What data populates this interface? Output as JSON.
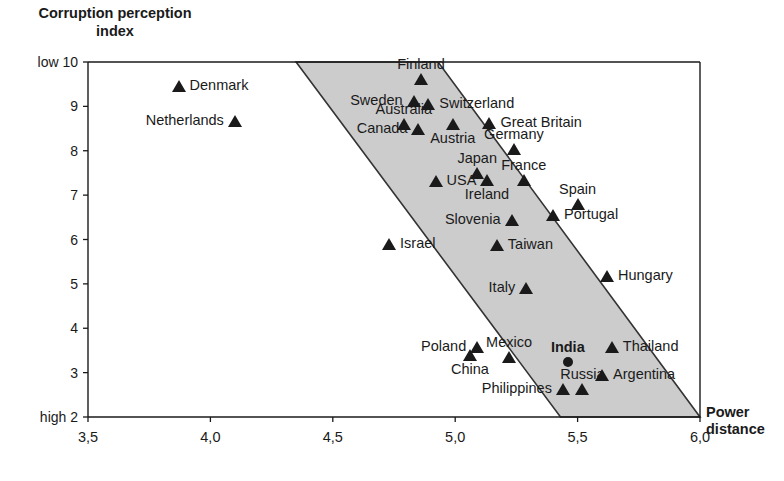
{
  "chart_data": {
    "type": "scatter",
    "title": "Corruption perception index",
    "ylabel": "Corruption perception\nindex",
    "xlabel": "Power\ndistance",
    "xlim": [
      3.5,
      6.0
    ],
    "ylim": [
      2,
      10
    ],
    "x_ticks": [
      "3,5",
      "4,0",
      "4,5",
      "5,0",
      "5,5",
      "6,0"
    ],
    "x_tick_values": [
      3.5,
      4.0,
      4.5,
      5.0,
      5.5,
      6.0
    ],
    "y_ticks": [
      "10",
      "9",
      "8",
      "7",
      "6",
      "5",
      "4",
      "3",
      "2"
    ],
    "y_tick_values": [
      10,
      9,
      8,
      7,
      6,
      5,
      4,
      3,
      2
    ],
    "y_axis_end_low": "low",
    "y_axis_end_high": "high",
    "grid": false,
    "legend": "none",
    "band": {
      "label": "trend-band",
      "fill": "#cccccc",
      "stroke": "#333333",
      "corners_data": [
        [
          4.35,
          10.0
        ],
        [
          4.93,
          10.0
        ],
        [
          6.0,
          2.0
        ],
        [
          5.43,
          2.0
        ]
      ]
    },
    "points": [
      {
        "name": "Denmark",
        "x": 3.87,
        "y": 9.45,
        "marker": "triangle",
        "label_side": "right",
        "bold": false
      },
      {
        "name": "Netherlands",
        "x": 4.1,
        "y": 8.68,
        "marker": "triangle",
        "label_side": "left",
        "bold": false
      },
      {
        "name": "Finland",
        "x": 4.86,
        "y": 9.62,
        "marker": "triangle",
        "label_side": "above",
        "bold": false
      },
      {
        "name": "Sweden",
        "x": 4.83,
        "y": 9.12,
        "marker": "triangle",
        "label_side": "left",
        "bold": false
      },
      {
        "name": "Switzerland",
        "x": 4.89,
        "y": 9.05,
        "marker": "triangle",
        "label_side": "right",
        "bold": false
      },
      {
        "name": "Australia",
        "x": 4.79,
        "y": 8.6,
        "marker": "triangle",
        "label_side": "above",
        "bold": false
      },
      {
        "name": "Canada",
        "x": 4.85,
        "y": 8.48,
        "marker": "triangle",
        "label_side": "left",
        "bold": false
      },
      {
        "name": "Austria",
        "x": 4.99,
        "y": 8.6,
        "marker": "triangle",
        "label_side": "below",
        "bold": false
      },
      {
        "name": "Great Britain",
        "x": 5.14,
        "y": 8.62,
        "marker": "triangle",
        "label_side": "right",
        "bold": false
      },
      {
        "name": "Germany",
        "x": 5.24,
        "y": 8.05,
        "marker": "triangle",
        "label_side": "above",
        "bold": false
      },
      {
        "name": "Japan",
        "x": 5.09,
        "y": 7.5,
        "marker": "triangle",
        "label_side": "above",
        "bold": false
      },
      {
        "name": "France",
        "x": 5.28,
        "y": 7.35,
        "marker": "triangle",
        "label_side": "above",
        "bold": false
      },
      {
        "name": "USA",
        "x": 4.92,
        "y": 7.32,
        "marker": "triangle",
        "label_side": "right",
        "bold": false
      },
      {
        "name": "Ireland",
        "x": 5.13,
        "y": 7.33,
        "marker": "triangle",
        "label_side": "below",
        "bold": false
      },
      {
        "name": "Spain",
        "x": 5.5,
        "y": 6.8,
        "marker": "triangle",
        "label_side": "above",
        "bold": false
      },
      {
        "name": "Portugal",
        "x": 5.4,
        "y": 6.55,
        "marker": "triangle",
        "label_side": "right",
        "bold": false
      },
      {
        "name": "Slovenia",
        "x": 5.23,
        "y": 6.45,
        "marker": "triangle",
        "label_side": "left",
        "bold": false
      },
      {
        "name": "Israel",
        "x": 4.73,
        "y": 5.9,
        "marker": "triangle",
        "label_side": "right",
        "bold": false
      },
      {
        "name": "Taiwan",
        "x": 5.17,
        "y": 5.88,
        "marker": "triangle",
        "label_side": "right",
        "bold": false
      },
      {
        "name": "Hungary",
        "x": 5.62,
        "y": 5.18,
        "marker": "triangle",
        "label_side": "right",
        "bold": false
      },
      {
        "name": "Italy",
        "x": 5.29,
        "y": 4.9,
        "marker": "triangle",
        "label_side": "left",
        "bold": false
      },
      {
        "name": "Poland",
        "x": 5.09,
        "y": 3.58,
        "marker": "triangle",
        "label_side": "left",
        "bold": false
      },
      {
        "name": "Mexico",
        "x": 5.22,
        "y": 3.35,
        "marker": "triangle",
        "label_side": "above",
        "bold": false
      },
      {
        "name": "China",
        "x": 5.06,
        "y": 3.4,
        "marker": "triangle",
        "label_side": "below",
        "bold": false
      },
      {
        "name": "India",
        "x": 5.46,
        "y": 3.25,
        "marker": "circle",
        "label_side": "above",
        "bold": true
      },
      {
        "name": "Thailand",
        "x": 5.64,
        "y": 3.58,
        "marker": "triangle",
        "label_side": "right",
        "bold": false
      },
      {
        "name": "Argentina",
        "x": 5.6,
        "y": 2.95,
        "marker": "triangle",
        "label_side": "right",
        "bold": false
      },
      {
        "name": "Russia",
        "x": 5.52,
        "y": 2.62,
        "marker": "triangle",
        "label_side": "above",
        "bold": false
      },
      {
        "name": "Philippines",
        "x": 5.44,
        "y": 2.62,
        "marker": "triangle",
        "label_side": "left",
        "bold": false
      }
    ]
  },
  "axes": {
    "y_title": "Corruption perception\nindex",
    "x_title": "Power\ndistance",
    "low_marker": "low",
    "high_marker": "high"
  }
}
